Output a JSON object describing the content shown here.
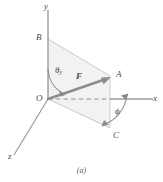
{
  "figure": {
    "caption": "(a)",
    "colors": {
      "axis": "#9a9a9a",
      "edge": "#b5b5b5",
      "vector": "#8f8f8f",
      "fill": "#f2f2f2",
      "text": "#4a4a4a",
      "dashed": "#8f8f8f"
    },
    "axes": [
      {
        "key": "y",
        "label": "y"
      },
      {
        "key": "x",
        "label": "x"
      },
      {
        "key": "z",
        "label": "z"
      }
    ],
    "points": [
      {
        "key": "O",
        "label": "O"
      },
      {
        "key": "B",
        "label": "B"
      },
      {
        "key": "A",
        "label": "A"
      },
      {
        "key": "C",
        "label": "C"
      }
    ],
    "vector": {
      "label": "F"
    },
    "angles": [
      {
        "key": "theta_y",
        "symbol": "θ",
        "subscript": "y"
      },
      {
        "key": "phi",
        "symbol": "ϕ"
      }
    ]
  }
}
